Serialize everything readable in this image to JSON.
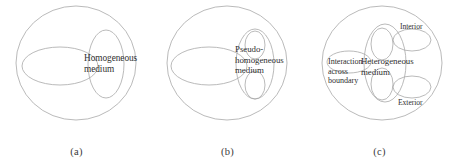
{
  "figure": {
    "panels": [
      {
        "id": "a",
        "caption": "(a)",
        "labels": [
          {
            "name": "homogeneous-medium-label",
            "text": "Homogeneous\nmedium",
            "lines": [
              "Homogeneous",
              "medium"
            ]
          }
        ],
        "shapes": {
          "outer_circle": {
            "cx": 76,
            "cy": 63,
            "rx": 60,
            "ry": 57
          },
          "left_ellipse": {
            "cx": 60,
            "cy": 66,
            "rx": 38,
            "ry": 19
          },
          "right_ellipse": {
            "cx": 106,
            "cy": 64,
            "rx": 18,
            "ry": 34
          }
        }
      },
      {
        "id": "b",
        "caption": "(b)",
        "labels": [
          {
            "name": "pseudo-homogeneous-medium-label",
            "text": "Pseudo-homogeneous medium",
            "lines": [
              "Pseudo-",
              "homogeneous",
              "medium"
            ]
          }
        ],
        "shapes": {
          "outer_circle": {
            "cx": 76,
            "cy": 63,
            "rx": 60,
            "ry": 57
          },
          "left_ellipse": {
            "cx": 58,
            "cy": 66,
            "rx": 38,
            "ry": 19
          },
          "right_ellipse": {
            "cx": 104,
            "cy": 64,
            "rx": 19,
            "ry": 35
          },
          "inner_top_ellipse": {
            "cx": 104,
            "cy": 45,
            "rx": 10,
            "ry": 14
          },
          "inner_bottom_ellipse": {
            "cx": 104,
            "cy": 85,
            "rx": 10,
            "ry": 14
          }
        }
      },
      {
        "id": "c",
        "caption": "(c)",
        "labels": [
          {
            "name": "heterogeneous-medium-label",
            "text": "Heterogeneous medium",
            "lines": [
              "Heterogeneous",
              "medium"
            ]
          },
          {
            "name": "interaction-across-boundary-label",
            "text": "Interaction across boundary",
            "lines": [
              "Interaction",
              "across",
              "boundary"
            ]
          },
          {
            "name": "interior-label",
            "text": "Interior",
            "lines": [
              "Interior"
            ]
          },
          {
            "name": "exterior-label",
            "text": "Exterior",
            "lines": [
              "Exterior"
            ]
          }
        ],
        "shapes": {
          "outer_circle": {
            "cx": 79,
            "cy": 63,
            "rx": 60,
            "ry": 57
          },
          "center_ellipse": {
            "cx": 82,
            "cy": 63,
            "rx": 21,
            "ry": 39
          },
          "center_top_ellipse": {
            "cx": 79,
            "cy": 44,
            "rx": 11,
            "ry": 16
          },
          "center_bottom_ellipse": {
            "cx": 79,
            "cy": 84,
            "rx": 11,
            "ry": 16
          },
          "right_top_ellipse": {
            "cx": 109,
            "cy": 40,
            "rx": 19,
            "ry": 11
          },
          "right_bottom_ellipse": {
            "cx": 109,
            "cy": 87,
            "rx": 19,
            "ry": 11
          },
          "boundary_ellipse": {
            "cx": 46,
            "cy": 62,
            "rx": 22,
            "ry": 11
          }
        }
      }
    ]
  },
  "style": {
    "stroke_color": "#a8a8a8",
    "stroke_width": 0.8,
    "text_color": "#2f2f2f",
    "background": "#ffffff"
  }
}
